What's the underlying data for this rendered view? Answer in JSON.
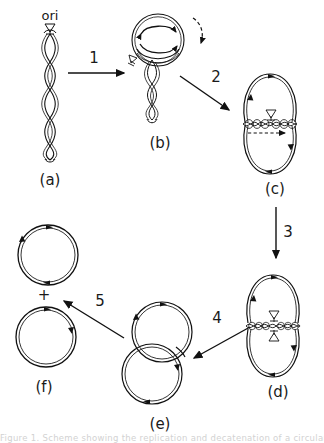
{
  "figure": {
    "background_color": "#ffffff",
    "line_color": "#111111",
    "caption": "Figure 1. Scheme showing the replication and decatenation of a circular",
    "ori_label": "ori",
    "plus_sign": "+"
  },
  "panels": [
    {
      "id": "a",
      "label": "(a)",
      "description": "linear intertwined duplex with ori marker at top"
    },
    {
      "id": "b",
      "label": "(b)",
      "description": "replication bubble loop with twisted unreplicated tail"
    },
    {
      "id": "c",
      "label": "(c)",
      "description": "two nearly complete circles joined by braided region"
    },
    {
      "id": "d",
      "label": "(d)",
      "description": "two circles joined by short catenated braid"
    },
    {
      "id": "e",
      "label": "(e)",
      "description": "two interlocked catenated circles"
    },
    {
      "id": "f",
      "label": "(f)",
      "description": "two separated daughter circles"
    }
  ],
  "steps": [
    {
      "id": "1",
      "label": "1",
      "from": "a",
      "to": "b",
      "direction": "right"
    },
    {
      "id": "2",
      "label": "2",
      "from": "b",
      "to": "c",
      "direction": "down-right"
    },
    {
      "id": "3",
      "label": "3",
      "from": "c",
      "to": "d",
      "direction": "down"
    },
    {
      "id": "4",
      "label": "4",
      "from": "d",
      "to": "e",
      "direction": "down-left"
    },
    {
      "id": "5",
      "label": "5",
      "from": "e",
      "to": "f",
      "direction": "up-left"
    }
  ],
  "markers": {
    "ori_marker_name": "ori-triangle-marker",
    "replication_fork_arrow": "curved-arrow",
    "dashed_arrow": "dashed-direction-arrow"
  }
}
